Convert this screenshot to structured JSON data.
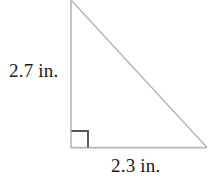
{
  "figure": {
    "kind": "right-triangle-diagram",
    "background_color": "#ffffff",
    "stroke_color": "#b7b7b7",
    "right_angle_marker_color": "#555555",
    "label_color": "#1a1a1a",
    "vertices": {
      "top": [
        71,
        0
      ],
      "bottom_left": [
        71,
        148
      ],
      "bottom_right": [
        207,
        148
      ]
    },
    "right_angle_marker": {
      "present": true,
      "corner": "bottom-left",
      "size": 17
    },
    "labels": {
      "vertical_leg": "2.7 in.",
      "horizontal_leg": "2.3 in."
    }
  }
}
